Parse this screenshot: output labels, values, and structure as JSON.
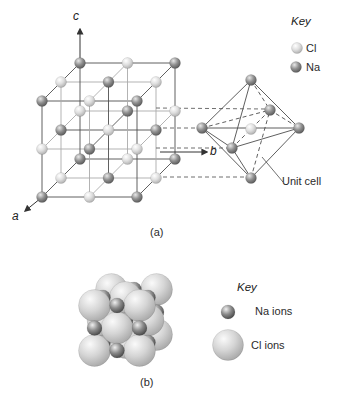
{
  "panel_a": {
    "label": "(a)",
    "axes": {
      "a": "a",
      "b": "b",
      "c": "c"
    },
    "key": {
      "title": "Key",
      "items": [
        {
          "id": "cl",
          "label": "Cl"
        },
        {
          "id": "na",
          "label": "Na"
        }
      ]
    },
    "unit_cell_label": "Unit cell"
  },
  "panel_b": {
    "label": "(b)",
    "key": {
      "title": "Key",
      "items": [
        {
          "id": "na",
          "label": "Na ions"
        },
        {
          "id": "cl",
          "label": "Cl ions"
        }
      ]
    }
  },
  "colors": {
    "line_dark": "#4f4f4f",
    "line_gray": "#aaaaaa",
    "dash_line": "#5f5f5f",
    "edge_line": "#4d4d4d",
    "axis_line": "#333333",
    "text": "#2b2b2b",
    "background": "#ffffff"
  },
  "gradients": {
    "cl": [
      "#ffffff",
      "#dedede",
      "#9f9f9f"
    ],
    "na": [
      "#e8e8e8",
      "#909090",
      "#474747"
    ],
    "clb": [
      "#fafafa",
      "#d5d5d5",
      "#9a9a9a"
    ],
    "nab": [
      "#efefef",
      "#8a8a8a",
      "#333333"
    ]
  },
  "geometry": {
    "lattice": {
      "origin": [
        42,
        197
      ],
      "x_step": [
        47.5,
        0
      ],
      "z_step": [
        0,
        -48
      ],
      "d_step": [
        19,
        -19
      ],
      "n": 3,
      "r": 5.5
    },
    "axes": {
      "a": {
        "from": [
          41,
          198
        ],
        "to": [
          25,
          211
        ]
      },
      "b": {
        "from": [
          160,
          152
        ],
        "to": [
          207,
          152
        ]
      },
      "c": {
        "from": [
          80,
          60
        ],
        "to": [
          80,
          29
        ]
      }
    },
    "connectors": [
      [
        156,
        108,
        266,
        109
      ],
      [
        156,
        128,
        199,
        128
      ],
      [
        156,
        148,
        229,
        148
      ],
      [
        156,
        177,
        247,
        177
      ]
    ],
    "octahedron": {
      "vertices": {
        "top": [
          251,
          80
        ],
        "bottom": [
          251,
          178
        ],
        "left": [
          202,
          128
        ],
        "right": [
          299,
          128
        ],
        "front": [
          232,
          148
        ],
        "back": [
          270,
          110
        ]
      },
      "center": [
        251,
        129
      ],
      "r": 5.5,
      "solid_edges": [
        [
          "top",
          "left"
        ],
        [
          "top",
          "right"
        ],
        [
          "top",
          "front"
        ],
        [
          "bottom",
          "left"
        ],
        [
          "bottom",
          "right"
        ],
        [
          "bottom",
          "front"
        ],
        [
          "left",
          "front"
        ],
        [
          "front",
          "right"
        ],
        [
          "left",
          "right"
        ]
      ],
      "dashed_edges": [
        [
          "top",
          "back"
        ],
        [
          "left",
          "back"
        ],
        [
          "back",
          "right"
        ],
        [
          "bottom",
          "back"
        ],
        [
          "front",
          "back"
        ]
      ]
    },
    "unit_cell_pointer": [
      283,
      182,
      262,
      157
    ],
    "key_a": {
      "cl": [
        297,
        48
      ],
      "na": [
        296,
        67
      ],
      "r": 5.5
    },
    "cluster": {
      "center": [
        117,
        328
      ],
      "half": 22.5,
      "cl_r": 16,
      "na_r": 7.5,
      "layer_offsets": [
        [
          17,
          -16
        ],
        [
          8.5,
          -8
        ],
        [
          0,
          0
        ]
      ]
    },
    "key_b": {
      "na": [
        228,
        312,
        7
      ],
      "cl": [
        228,
        345,
        15.5
      ]
    }
  }
}
